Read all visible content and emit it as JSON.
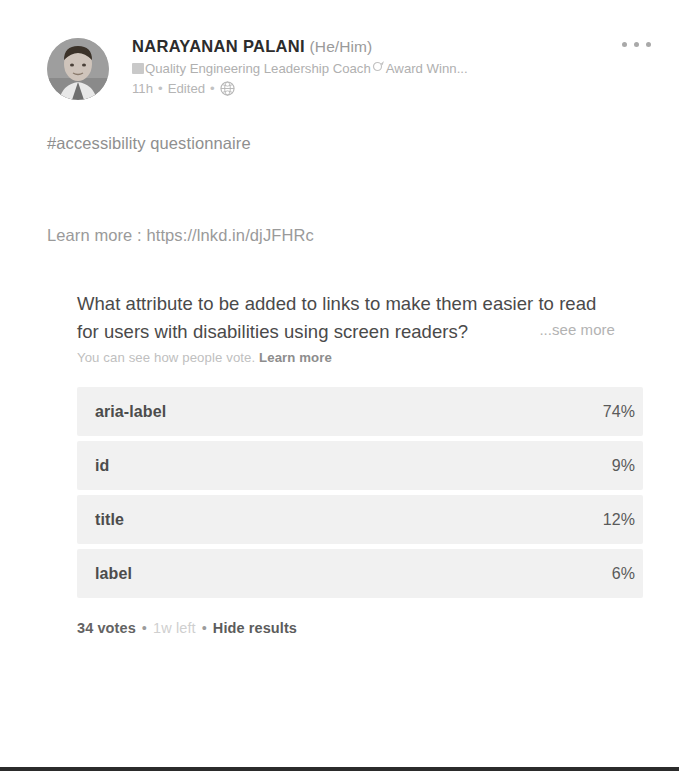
{
  "post": {
    "author": {
      "name": "NARAYANAN PALANI",
      "pronouns": "(He/Him)",
      "headline": "Quality Engineering Leadership Coach",
      "headline_suffix": "Award Winn...",
      "headline_badge_icon": "page-badge-icon",
      "headline_medal_icon": "medal-icon",
      "avatar_icon": "profile-photo"
    },
    "meta": {
      "time": "11h",
      "separator": "•",
      "edited": "Edited",
      "visibility_icon": "globe-icon"
    },
    "more_menu_icon": "ellipsis-icon",
    "hashtag": "#accessibility questionnaire",
    "link_line": "Learn more : https://lnkd.in/djJFHRc"
  },
  "poll": {
    "question": "What attribute to be added to links to make them easier to read for users with disabilities using screen readers?",
    "see_more": "...see more",
    "subtext_normal": "You can see how people vote. ",
    "subtext_link": "Learn more",
    "options": [
      {
        "label": "aria-label",
        "percent": "74%",
        "value": 74
      },
      {
        "label": "id",
        "percent": "9%",
        "value": 9
      },
      {
        "label": "title",
        "percent": "12%",
        "value": 12
      },
      {
        "label": "label",
        "percent": "6%",
        "value": 6
      }
    ],
    "footer": {
      "votes": "34 votes",
      "sep1": "•",
      "time_left": "1w left",
      "sep2": "•",
      "hide_results": "Hide results"
    }
  },
  "colors": {
    "bar_fill": "#f1f1f1",
    "text_primary": "#4c4c4c",
    "text_muted": "#b5b5b5",
    "bottom_rule": "#2b2b2b"
  }
}
